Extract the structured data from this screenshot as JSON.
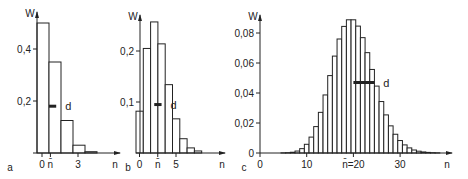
{
  "colors": {
    "ink": "#222222",
    "bar_fill": "#ffffff",
    "background": "#ffffff"
  },
  "chart_data": [
    {
      "id": "a",
      "type": "bar",
      "panel_label": "a",
      "xlabel": "n",
      "ylabel": "W",
      "x": [
        0,
        1,
        2,
        3,
        4
      ],
      "values": [
        0.5,
        0.35,
        0.125,
        0.03,
        0.005
      ],
      "yticks": [
        0.2,
        0.4
      ],
      "ytick_labels": [
        "0,2",
        "0,4"
      ],
      "xtick_labels": [
        {
          "x": 0,
          "label": "0"
        },
        {
          "x": 0.7,
          "label": "n̄"
        },
        {
          "x": 3,
          "label": "3"
        }
      ],
      "mean": 0.7,
      "d_annotation": {
        "label": "d",
        "y": 0.18,
        "from": 1.0,
        "to": 1.6
      },
      "ylim": [
        0,
        0.5
      ],
      "grid": false
    },
    {
      "id": "b",
      "type": "bar",
      "panel_label": "b",
      "xlabel": "n",
      "ylabel": "W",
      "x": [
        0,
        1,
        2,
        3,
        4,
        5,
        6,
        7,
        8
      ],
      "values": [
        0.082,
        0.205,
        0.257,
        0.214,
        0.134,
        0.067,
        0.028,
        0.01,
        0.004
      ],
      "yticks": [
        0.1,
        0.2
      ],
      "ytick_labels": [
        "0,1",
        "0,2"
      ],
      "xtick_labels": [
        {
          "x": 0,
          "label": "0"
        },
        {
          "x": 2.5,
          "label": "n̄"
        },
        {
          "x": 5,
          "label": "5"
        }
      ],
      "mean": 2.5,
      "d_annotation": {
        "label": "d",
        "y": 0.095,
        "from": 2.5,
        "to": 3.5
      },
      "ylim": [
        0,
        0.26
      ],
      "grid": false
    },
    {
      "id": "c",
      "type": "bar",
      "panel_label": "c",
      "title": "",
      "xlabel": "n",
      "ylabel": "W",
      "x": [
        5,
        6,
        7,
        8,
        9,
        10,
        11,
        12,
        13,
        14,
        15,
        16,
        17,
        18,
        19,
        20,
        21,
        22,
        23,
        24,
        25,
        26,
        27,
        28,
        29,
        30,
        31,
        32,
        33,
        34,
        35,
        36,
        37,
        38
      ],
      "values": [
        0.0001,
        0.0002,
        0.0005,
        0.0013,
        0.0029,
        0.0058,
        0.0106,
        0.0176,
        0.0271,
        0.0387,
        0.0516,
        0.0646,
        0.076,
        0.0844,
        0.0888,
        0.0888,
        0.0846,
        0.0769,
        0.0669,
        0.0557,
        0.0446,
        0.0343,
        0.0254,
        0.0181,
        0.0125,
        0.0083,
        0.0054,
        0.0034,
        0.002,
        0.0012,
        0.0007,
        0.0004,
        0.0002,
        0.0001
      ],
      "yticks": [
        0,
        0.02,
        0.04,
        0.06,
        0.08
      ],
      "ytick_labels": [
        "0",
        "0,02",
        "0,04",
        "0,06",
        "0,08"
      ],
      "xtick_labels": [
        {
          "x": 0,
          "label": "0"
        },
        {
          "x": 10,
          "label": "10"
        },
        {
          "x": 20,
          "label": "n̄=20"
        },
        {
          "x": 30,
          "label": "30"
        }
      ],
      "mean": 20,
      "d_annotation": {
        "label": "d",
        "y": 0.047,
        "from": 20,
        "to": 24.5
      },
      "ylim": [
        0,
        0.09
      ],
      "xlim": [
        0,
        40
      ],
      "grid": false
    }
  ]
}
